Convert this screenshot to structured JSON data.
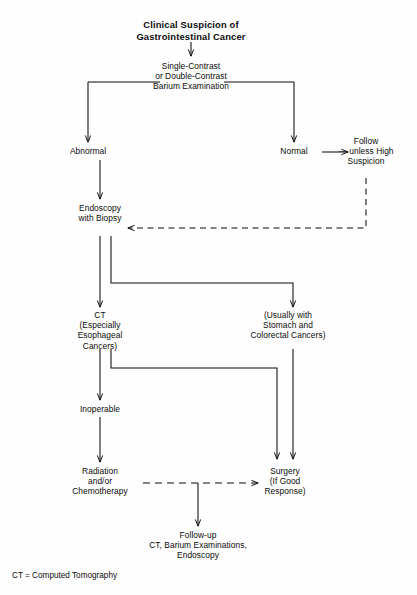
{
  "figure": {
    "title_lines": [
      "Clinical Suspicion of",
      "Gastrointestinal Cancer"
    ],
    "legend": "CT = Computed Tomography",
    "ink_color": "#0b0b0b",
    "background_color": "#ffffff"
  },
  "nodes": {
    "suspicion": {
      "name": "clinical-suspicion",
      "lines": [
        "Clinical Suspicion of",
        "Gastrointestinal Cancer"
      ]
    },
    "barium": {
      "name": "barium-examination",
      "lines": [
        "Single-Contrast",
        "or Double-Contrast",
        "Barium Examination"
      ]
    },
    "abnormal": {
      "name": "abnormal",
      "lines": [
        "Abnormal"
      ]
    },
    "normal": {
      "name": "normal",
      "lines": [
        "Normal"
      ]
    },
    "follow": {
      "name": "follow-unless-high-suspicion",
      "lines": [
        "Follow",
        "— unless High",
        "Suspicion"
      ]
    },
    "endoscopy": {
      "name": "endoscopy-with-biopsy",
      "lines": [
        "Endoscopy",
        "with Biopsy"
      ]
    },
    "ct": {
      "name": "ct-especially-esophageal-cancers",
      "lines": [
        "CT",
        "(Especially",
        "Esophageal",
        "Cancers)"
      ]
    },
    "usually": {
      "name": "usually-with-stomach-colorectal-cancers",
      "lines": [
        "(Usually with",
        "Stomach and",
        "Colorectal Cancers)"
      ]
    },
    "inoperable": {
      "name": "inoperable",
      "lines": [
        "Inoperable"
      ]
    },
    "radiation": {
      "name": "radiation-chemotherapy",
      "lines": [
        "Radiation",
        "and/or",
        "Chemotherapy"
      ]
    },
    "surgery": {
      "name": "surgery-if-good-response",
      "lines": [
        "Surgery",
        "(If Good",
        "Response)"
      ]
    },
    "followup": {
      "name": "follow-up",
      "lines": [
        "Follow-up",
        "CT, Barium Examinations,",
        "Endoscopy"
      ]
    }
  },
  "edges": [
    {
      "name": "suspicion-to-barium",
      "style": "solid",
      "arrow": true
    },
    {
      "name": "barium-split-bar",
      "style": "solid",
      "arrow": false
    },
    {
      "name": "barium-to-abnormal",
      "style": "solid",
      "arrow": true
    },
    {
      "name": "barium-to-normal",
      "style": "solid",
      "arrow": true
    },
    {
      "name": "normal-to-follow",
      "style": "solid",
      "arrow": true
    },
    {
      "name": "follow-to-endoscopy",
      "style": "dashed",
      "arrow": true
    },
    {
      "name": "abnormal-to-endoscopy",
      "style": "solid",
      "arrow": true
    },
    {
      "name": "endoscopy-to-ct",
      "style": "solid",
      "arrow": true
    },
    {
      "name": "endoscopy-to-usually",
      "style": "solid",
      "arrow": true
    },
    {
      "name": "ct-to-inoperable",
      "style": "solid",
      "arrow": true
    },
    {
      "name": "ct-to-surgery",
      "style": "solid",
      "arrow": true
    },
    {
      "name": "usually-to-surgery",
      "style": "solid",
      "arrow": true
    },
    {
      "name": "inoperable-to-radiation",
      "style": "solid",
      "arrow": true
    },
    {
      "name": "radiation-to-surgery",
      "style": "dashed",
      "arrow": true
    },
    {
      "name": "treatment-to-followup",
      "style": "solid",
      "arrow": true
    }
  ]
}
